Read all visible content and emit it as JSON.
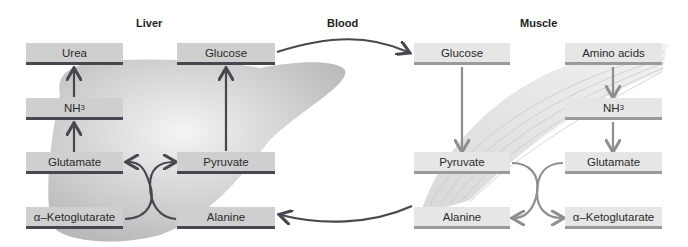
{
  "titles": {
    "liver": "Liver",
    "blood": "Blood",
    "muscle": "Muscle"
  },
  "liver": {
    "urea": "Urea",
    "nh3": "NH",
    "nh3_sub": "3",
    "glutamate": "Glutamate",
    "ketoglutarate": "α–Ketoglutarate",
    "glucose": "Glucose",
    "pyruvate": "Pyruvate",
    "alanine": "Alanine"
  },
  "muscle": {
    "glucose": "Glucose",
    "pyruvate": "Pyruvate",
    "alanine": "Alanine",
    "amino_acids": "Amino acids",
    "nh3": "NH",
    "nh3_sub": "3",
    "glutamate": "Glutamate",
    "ketoglutarate": "α–Ketoglutarate"
  },
  "colors": {
    "liver_arrow": "#4a4650",
    "muscle_arrow": "#8f8f8f",
    "liver_box": "#cfcfcf",
    "muscle_box": "#e6e6e6"
  }
}
